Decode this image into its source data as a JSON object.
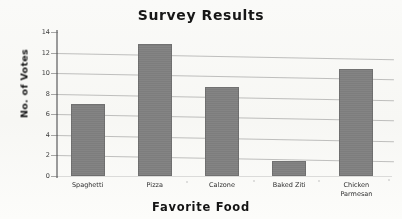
{
  "chart_data": {
    "type": "bar",
    "title": "Survey Results",
    "xlabel": "Favorite Food",
    "ylabel": "No. of Votes",
    "categories": [
      "Spaghetti",
      "Pizza",
      "Calzone",
      "Baked Ziti",
      "Chicken Parmesan"
    ],
    "values": [
      7,
      12.8,
      8.7,
      1.5,
      10.4
    ],
    "ylim": [
      0,
      14
    ],
    "yticks": [
      0,
      2,
      4,
      6,
      8,
      10,
      12,
      14
    ],
    "ytick_labels": [
      "0",
      "2",
      "4",
      "6",
      "8",
      "10",
      "12",
      "14"
    ],
    "grid": true,
    "legend": null,
    "bar_color": "#7f7f7f",
    "background_color": "#fbfbf9"
  },
  "labels": {
    "category_display": [
      "Spaghetti",
      "Pizza",
      "Calzone",
      "Baked Ziti",
      "Chicken\nParmesan"
    ]
  }
}
